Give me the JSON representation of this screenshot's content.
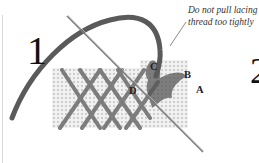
{
  "diagram": {
    "step_numbers": [
      "1",
      "2"
    ],
    "caption": {
      "line1": "Do not pull lacing",
      "line2": "thread too tightly"
    },
    "point_labels": {
      "A": "A",
      "B": "B",
      "C": "C",
      "D": "D"
    },
    "colors": {
      "background": "#ffffff",
      "thread": "#5a5a5a",
      "canvas": "#e6e6e6",
      "needle": "#7a7a7a",
      "text": "#222222"
    }
  }
}
